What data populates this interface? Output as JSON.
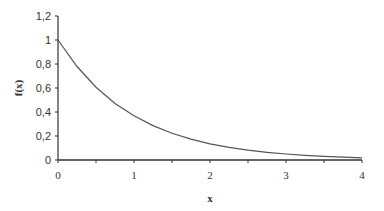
{
  "chart_data": {
    "type": "line",
    "title": "",
    "xlabel": "x",
    "ylabel": "f(x)",
    "xlim": [
      0,
      4
    ],
    "ylim": [
      0,
      1.2
    ],
    "x_ticks": [
      "0",
      "1",
      "2",
      "3",
      "4"
    ],
    "y_ticks": [
      "0",
      "0,2",
      "0,4",
      "0,6",
      "0,8",
      "1",
      "1,2"
    ],
    "grid": false,
    "legend": null,
    "series": [
      {
        "name": "f(x)",
        "x": [
          0,
          0.25,
          0.5,
          0.75,
          1,
          1.25,
          1.5,
          1.75,
          2,
          2.25,
          2.5,
          2.75,
          3,
          3.25,
          3.5,
          3.75,
          4
        ],
        "values": [
          1.0,
          0.779,
          0.607,
          0.472,
          0.368,
          0.287,
          0.223,
          0.174,
          0.135,
          0.105,
          0.082,
          0.064,
          0.05,
          0.039,
          0.03,
          0.024,
          0.018
        ]
      }
    ],
    "colors": {
      "line": "#555555",
      "axis": "#333333"
    }
  }
}
